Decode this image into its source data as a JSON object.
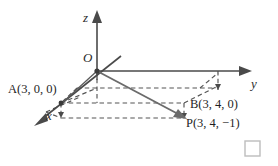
{
  "figure": {
    "background_color": "#ffffff",
    "ink_color": "#3a3a3a",
    "width": 278,
    "height": 166
  },
  "axes": [
    {
      "id": "z",
      "label": "z",
      "label_x": 86,
      "label_y": 17,
      "direction": "up"
    },
    {
      "id": "y",
      "label": "y",
      "label_x": 254,
      "label_y": 86,
      "direction": "right"
    },
    {
      "id": "x",
      "label": "x",
      "label_x": 49,
      "label_y": 119,
      "direction": "down-left"
    }
  ],
  "origin": {
    "name": "origin-label",
    "label": "O",
    "label_x": 83,
    "label_y": 62,
    "px": 97,
    "py": 71
  },
  "points": [
    {
      "id": "A",
      "name": "A",
      "coords": "(3, 0, 0)",
      "label": "A(3, 0, 0)",
      "label_x": 8,
      "label_y": 93,
      "px": 61,
      "py": 103
    },
    {
      "id": "B",
      "name": "B",
      "coords": "(3, 4, 0)",
      "label": "B(3, 4, 0)",
      "label_x": 190,
      "label_y": 108,
      "px": 184,
      "py": 103
    },
    {
      "id": "P",
      "name": "P",
      "coords": "(3, 4, −1)",
      "label": "P(3, 4, −1)",
      "label_x": 185,
      "label_y": 126,
      "px": 184,
      "py": 119
    }
  ],
  "vectors": [
    {
      "id": "OP",
      "from": "O",
      "to": "P",
      "style": "solid-arrow"
    }
  ],
  "qed_marker": {
    "label": "end-of-proof-square",
    "x": 245,
    "y": 141,
    "size": 15,
    "color": "#bdbdbd"
  }
}
